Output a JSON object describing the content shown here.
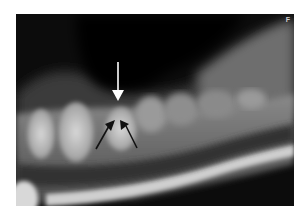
{
  "figure": {
    "type": "dental radiograph",
    "corner_label": "F",
    "annotations": [
      {
        "name": "white-arrow",
        "color": "#ffffff",
        "direction": "down"
      },
      {
        "name": "black-arrow-left",
        "color": "#111111",
        "direction": "up-right"
      },
      {
        "name": "black-arrow-right",
        "color": "#111111",
        "direction": "up-left"
      }
    ]
  }
}
